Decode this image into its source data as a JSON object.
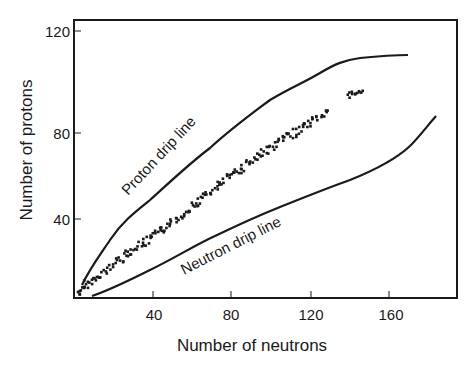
{
  "chart_data": {
    "type": "scatter",
    "title": "",
    "xlabel": "Number of neutrons",
    "ylabel": "Number of protons",
    "xlim": [
      0,
      195
    ],
    "ylim": [
      0,
      124
    ],
    "x_ticks": [
      40,
      80,
      120,
      160
    ],
    "y_ticks": [
      40,
      80,
      120
    ],
    "grid": false,
    "legend": null,
    "annotations": [
      {
        "text": "Proton drip line",
        "x": 38,
        "y": 60,
        "rotation": -47
      },
      {
        "text": "Neutron drip line",
        "x": 88,
        "y": 25,
        "rotation": -27
      }
    ],
    "series": [
      {
        "name": "Proton drip line",
        "type": "line",
        "x": [
          4,
          10,
          23,
          35,
          49,
          63,
          79,
          95,
          110,
          125,
          143,
          158,
          170
        ],
        "y": [
          6,
          16,
          40,
          53,
          67,
          76,
          85,
          92,
          97,
          101,
          107,
          108,
          109
        ]
      },
      {
        "name": "Neutron drip line",
        "type": "line",
        "x": [
          9,
          25,
          44,
          65,
          89,
          115,
          140,
          160,
          183
        ],
        "y": [
          1,
          7,
          15,
          28,
          40,
          50,
          60,
          72,
          88
        ]
      },
      {
        "name": "Stable nuclei",
        "type": "scatter",
        "x": [
          3,
          4,
          5,
          6,
          8,
          10,
          12,
          14,
          16,
          18,
          20,
          22,
          24,
          26,
          28,
          30,
          32,
          34,
          36,
          38,
          40,
          42,
          44,
          46,
          48,
          50,
          52,
          54,
          56,
          58,
          60,
          62,
          64,
          66,
          68,
          70,
          72,
          74,
          76,
          78,
          80,
          82,
          84,
          86,
          88,
          90,
          92,
          94,
          96,
          98,
          100,
          102,
          104,
          106,
          108,
          110,
          112,
          114,
          116,
          118,
          120,
          122,
          124,
          126,
          128,
          140,
          142,
          144,
          146
        ],
        "y": [
          2,
          5,
          4,
          7,
          8,
          9,
          10,
          12,
          13,
          15,
          17,
          19,
          20,
          22,
          23,
          24,
          26,
          27,
          28,
          29,
          31,
          32,
          34,
          35,
          37,
          38,
          40,
          41,
          43,
          45,
          46,
          47,
          49,
          50,
          52,
          53,
          54,
          56,
          57,
          59,
          60,
          62,
          63,
          64,
          66,
          67,
          68,
          70,
          71,
          72,
          73,
          74,
          76,
          77,
          78,
          79,
          80,
          81,
          82,
          83,
          84,
          85,
          86,
          87,
          88,
          95,
          96,
          95,
          96
        ]
      }
    ]
  },
  "axes": {
    "x_title": "Number of neutrons",
    "y_title": "Number of protons",
    "x_tick_labels": [
      "40",
      "80",
      "120",
      "160"
    ],
    "y_tick_labels": [
      "40",
      "80",
      "120"
    ]
  },
  "labels": {
    "proton_drip": "Proton drip line",
    "neutron_drip": "Neutron drip line"
  }
}
